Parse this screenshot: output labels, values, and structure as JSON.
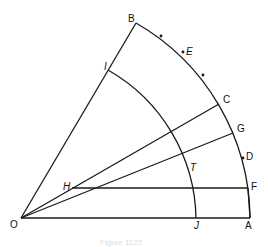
{
  "diagram": {
    "caption": "Figure 1122",
    "points": {
      "O": {
        "label": "O",
        "x": 21,
        "y": 218
      },
      "A": {
        "label": "A",
        "x": 250,
        "y": 218
      },
      "B": {
        "label": "B",
        "x": 136,
        "y": 23
      },
      "C": {
        "label": "C",
        "x": 219,
        "y": 104
      },
      "D": {
        "label": "D",
        "x": 243,
        "y": 158
      },
      "E": {
        "label": "E",
        "x": 183,
        "y": 52
      },
      "F": {
        "label": "F",
        "x": 248,
        "y": 188
      },
      "G": {
        "label": "G",
        "x": 233,
        "y": 133
      },
      "H": {
        "label": "H",
        "x": 72,
        "y": 188
      },
      "I": {
        "label": "I",
        "x": 108,
        "y": 70
      },
      "J": {
        "label": "J",
        "x": 196,
        "y": 218
      },
      "T": {
        "label": "T",
        "x": 187,
        "y": 159
      }
    },
    "segments": [
      "OA",
      "OB",
      "OC",
      "OG",
      "HC",
      "HF",
      "AF"
    ],
    "arcs": [
      "BA (outer arc, center O)",
      "IJ (inner arc, center O)"
    ],
    "ticks": [
      "between B and E",
      "between E and C",
      "D"
    ]
  }
}
